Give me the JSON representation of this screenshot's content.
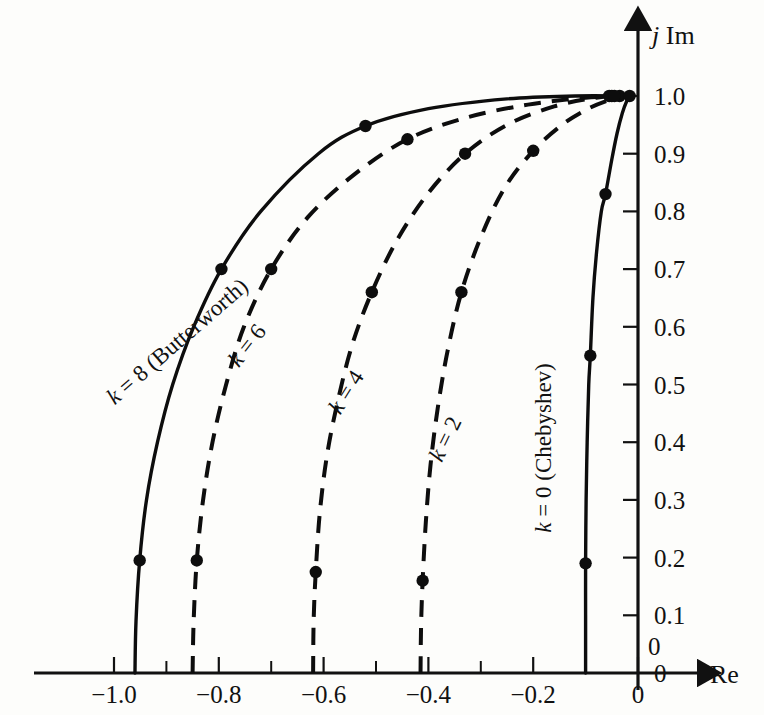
{
  "figure": {
    "title": "",
    "background_color": "#fdfdfb",
    "ink_color": "#0d0d0d"
  },
  "axes": {
    "x_axis_label": "Re",
    "y_axis_label_italic": "j",
    "y_axis_label_rest": " Im",
    "x_ticks": [
      "−1.0",
      "−0.8",
      "−0.6",
      "−0.4",
      "−0.2",
      "0"
    ],
    "x_tick_values": [
      -1.0,
      -0.8,
      -0.6,
      -0.4,
      -0.2,
      0
    ],
    "x_minor_values": [
      -0.9,
      -0.7,
      -0.5,
      -0.3,
      -0.1
    ],
    "y_ticks": [
      "1.0",
      "0.9",
      "0.8",
      "0.7",
      "0.6",
      "0.5",
      "0.4",
      "0.3",
      "0.2",
      "0.1",
      "0"
    ],
    "y_tick_values": [
      1.0,
      0.9,
      0.8,
      0.7,
      0.6,
      0.5,
      0.4,
      0.3,
      0.2,
      0.1,
      0.0
    ],
    "origin_label": "0",
    "xlim": [
      -1.08,
      0.02
    ],
    "ylim": [
      -0.04,
      1.07
    ]
  },
  "chart_data": {
    "type": "line",
    "title": "",
    "xlabel": "Re",
    "ylabel": "j Im",
    "xlim": [
      -1.08,
      0.02
    ],
    "ylim": [
      -0.04,
      1.07
    ],
    "grid": false,
    "legend": "inline-curve-labels",
    "series": [
      {
        "name": "k = 8 (Butterworth)",
        "label": "k = 8 (Butterworth)",
        "k": 8,
        "style": "solid",
        "label_x": -0.87,
        "label_y": 0.565,
        "label_rotation": -41,
        "path": [
          [
            -0.96,
            0.0
          ],
          [
            -0.958,
            0.09
          ],
          [
            -0.951,
            0.195
          ],
          [
            -0.938,
            0.3
          ],
          [
            -0.917,
            0.4
          ],
          [
            -0.888,
            0.5
          ],
          [
            -0.848,
            0.6
          ],
          [
            -0.795,
            0.7
          ],
          [
            -0.72,
            0.8
          ],
          [
            -0.61,
            0.9
          ],
          [
            -0.52,
            0.948
          ],
          [
            -0.4,
            0.978
          ],
          [
            -0.25,
            0.995
          ],
          [
            -0.12,
            1.0
          ],
          [
            -0.03,
            1.0
          ]
        ],
        "points": [
          [
            -0.951,
            0.195
          ],
          [
            -0.795,
            0.7
          ],
          [
            -0.52,
            0.948
          ],
          [
            -0.035,
            1.0
          ]
        ]
      },
      {
        "name": "k = 6",
        "label": "k = 6",
        "k": 6,
        "style": "dashed",
        "label_x": -0.735,
        "label_y": 0.56,
        "label_rotation": -52,
        "path": [
          [
            -0.85,
            0.0
          ],
          [
            -0.848,
            0.09
          ],
          [
            -0.842,
            0.195
          ],
          [
            -0.83,
            0.3
          ],
          [
            -0.812,
            0.4
          ],
          [
            -0.786,
            0.5
          ],
          [
            -0.752,
            0.6
          ],
          [
            -0.7,
            0.7
          ],
          [
            -0.63,
            0.79
          ],
          [
            -0.54,
            0.865
          ],
          [
            -0.44,
            0.925
          ],
          [
            -0.33,
            0.962
          ],
          [
            -0.21,
            0.985
          ],
          [
            -0.1,
            0.997
          ],
          [
            -0.03,
            1.0
          ]
        ],
        "points": [
          [
            -0.842,
            0.195
          ],
          [
            -0.7,
            0.7
          ],
          [
            -0.44,
            0.925
          ],
          [
            -0.05,
            1.0
          ]
        ]
      },
      {
        "name": "k = 4",
        "label": "k = 4",
        "k": 4,
        "style": "dashed",
        "label_x": -0.545,
        "label_y": 0.48,
        "label_rotation": -58,
        "path": [
          [
            -0.62,
            0.0
          ],
          [
            -0.619,
            0.09
          ],
          [
            -0.615,
            0.175
          ],
          [
            -0.607,
            0.28
          ],
          [
            -0.593,
            0.38
          ],
          [
            -0.572,
            0.475
          ],
          [
            -0.545,
            0.57
          ],
          [
            -0.508,
            0.66
          ],
          [
            -0.46,
            0.75
          ],
          [
            -0.4,
            0.832
          ],
          [
            -0.33,
            0.9
          ],
          [
            -0.25,
            0.95
          ],
          [
            -0.16,
            0.982
          ],
          [
            -0.08,
            0.997
          ],
          [
            -0.03,
            1.0
          ]
        ],
        "points": [
          [
            -0.615,
            0.175
          ],
          [
            -0.508,
            0.66
          ],
          [
            -0.33,
            0.9
          ],
          [
            -0.055,
            1.0
          ]
        ]
      },
      {
        "name": "k = 2",
        "label": "k = 2",
        "k": 2,
        "style": "dashed",
        "label_x": -0.355,
        "label_y": 0.4,
        "label_rotation": -64,
        "path": [
          [
            -0.415,
            0.0
          ],
          [
            -0.414,
            0.08
          ],
          [
            -0.411,
            0.16
          ],
          [
            -0.405,
            0.26
          ],
          [
            -0.396,
            0.36
          ],
          [
            -0.382,
            0.46
          ],
          [
            -0.363,
            0.56
          ],
          [
            -0.337,
            0.66
          ],
          [
            -0.3,
            0.755
          ],
          [
            -0.255,
            0.84
          ],
          [
            -0.2,
            0.905
          ],
          [
            -0.145,
            0.95
          ],
          [
            -0.095,
            0.978
          ],
          [
            -0.055,
            0.993
          ],
          [
            -0.025,
            1.0
          ]
        ],
        "points": [
          [
            -0.411,
            0.16
          ],
          [
            -0.337,
            0.66
          ],
          [
            -0.2,
            0.905
          ],
          [
            -0.045,
            1.0
          ]
        ]
      },
      {
        "name": "k = 0 (Chebyshev)",
        "label": "k = 0 (Chebyshev)",
        "k": 0,
        "style": "solid",
        "label_x": -0.165,
        "label_y": 0.39,
        "label_rotation": -90,
        "path": [
          [
            -0.1,
            0.0
          ],
          [
            -0.1,
            0.1
          ],
          [
            -0.1,
            0.19
          ],
          [
            -0.099,
            0.3
          ],
          [
            -0.097,
            0.4
          ],
          [
            -0.094,
            0.5
          ],
          [
            -0.091,
            0.55
          ],
          [
            -0.086,
            0.65
          ],
          [
            -0.079,
            0.73
          ],
          [
            -0.07,
            0.8
          ],
          [
            -0.062,
            0.83
          ],
          [
            -0.05,
            0.89
          ],
          [
            -0.04,
            0.935
          ],
          [
            -0.03,
            0.97
          ],
          [
            -0.022,
            0.99
          ],
          [
            -0.015,
            1.0
          ]
        ],
        "points": [
          [
            -0.1,
            0.19
          ],
          [
            -0.091,
            0.55
          ],
          [
            -0.062,
            0.83
          ],
          [
            -0.016,
            1.0
          ]
        ]
      }
    ]
  }
}
